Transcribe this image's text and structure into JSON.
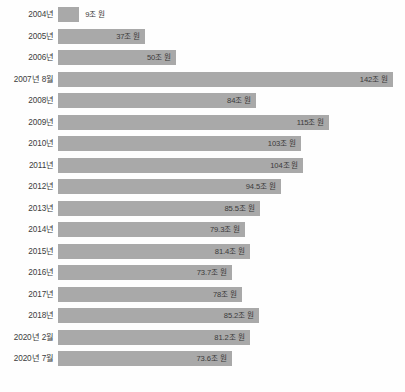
{
  "chart_data": {
    "type": "bar",
    "orientation": "horizontal",
    "title": "",
    "subtitle": "",
    "xlabel": "",
    "ylabel": "",
    "unit": "조 원",
    "grid": false,
    "legend": "none",
    "xlim": [
      0,
      142
    ],
    "categories": [
      "2004년",
      "2005년",
      "2006년",
      "2007년 8월",
      "2008년",
      "2009년",
      "2010년",
      "2011년",
      "2012년",
      "2013년",
      "2014년",
      "2015년",
      "2016년",
      "2017년",
      "2018년",
      "2020년 2월",
      "2020년 7월"
    ],
    "values": [
      9,
      37,
      50,
      142,
      84,
      115,
      103,
      104,
      94.5,
      85.5,
      79.3,
      81.4,
      73.7,
      78,
      85.2,
      81.2,
      73.6
    ],
    "value_labels": [
      "9조 원",
      "37조 원",
      "50조 원",
      "142조 원",
      "84조 원",
      "115조 원",
      "103조 원",
      "104조 원",
      "94.5조 원",
      "85.5조 원",
      "79.3조 원",
      "81.4조 원",
      "73.7조 원",
      "78조 원",
      "85.2조 원",
      "81.2조 원",
      "73.6조 원"
    ],
    "label_placement": [
      "outside",
      "inside",
      "inside",
      "inside",
      "inside",
      "inside",
      "inside",
      "inside",
      "inside",
      "inside",
      "inside",
      "inside",
      "inside",
      "inside",
      "inside",
      "inside",
      "inside"
    ],
    "colors": {
      "bar": "#a9a9a9",
      "background": "#fefefe",
      "category_text": "#3c3c3c",
      "value_text": "#3a3a3a"
    }
  }
}
